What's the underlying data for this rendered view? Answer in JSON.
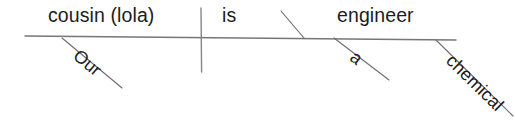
{
  "diagram": {
    "type": "sentence-diagram",
    "sentence": "Our cousin (lola) is a chemical engineer",
    "canvas": {
      "width": 515,
      "height": 134
    },
    "ink_color": "#1c1c1e",
    "line_color": "#76767a",
    "background_color": "#ffffff",
    "baseline": {
      "label": "main-horizontal-baseline",
      "x1": 25,
      "y1": 36,
      "x2": 456,
      "y2": 40
    },
    "divider": {
      "label": "subject-verb-divider",
      "x": 201,
      "y1": 8,
      "y2": 72
    },
    "predicate_slant": {
      "label": "predicate-nominative-slant",
      "x1": 281,
      "y1": 11,
      "x2": 304,
      "y2": 38
    },
    "slots": [
      {
        "id": "subject",
        "role": "subject",
        "text": "cousin (lola)"
      },
      {
        "id": "verb",
        "role": "linking-verb",
        "text": "is"
      },
      {
        "id": "predicate",
        "role": "predicate-nominative",
        "text": "engineer"
      }
    ],
    "modifiers": [
      {
        "id": "mod-our",
        "role": "possessive-adjective",
        "text": "Our",
        "attaches_to": "subject",
        "line": {
          "x1": 62,
          "y1": 38,
          "x2": 122,
          "y2": 88
        },
        "angle_deg": 39.5
      },
      {
        "id": "mod-a",
        "role": "article",
        "text": "a",
        "attaches_to": "predicate",
        "line": {
          "x1": 334,
          "y1": 38,
          "x2": 389,
          "y2": 80
        },
        "angle_deg": 37.5
      },
      {
        "id": "mod-chemical",
        "role": "adjective",
        "text": "chemical",
        "attaches_to": "predicate",
        "line": {
          "x1": 436,
          "y1": 40,
          "x2": 513,
          "y2": 116
        },
        "angle_deg": 44.5
      }
    ]
  }
}
